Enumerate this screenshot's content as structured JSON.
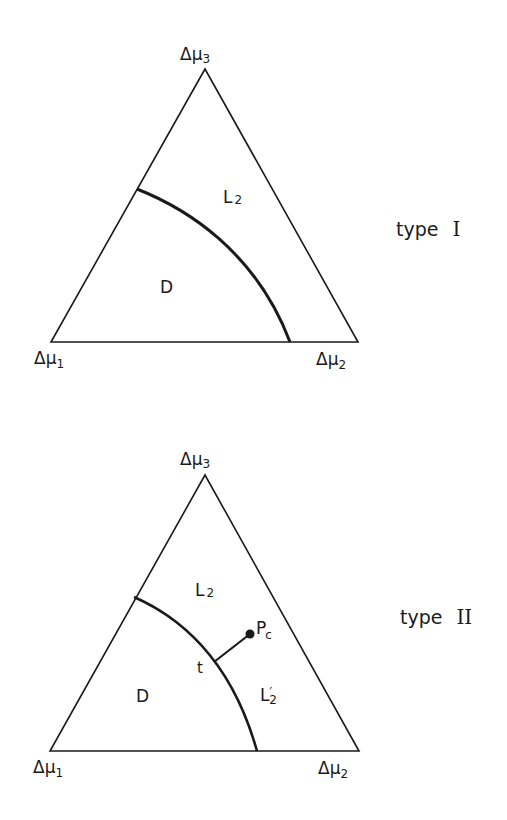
{
  "diagrams": [
    {
      "type_label": "type",
      "type_numeral": "I",
      "vertices": {
        "top": {
          "symbol": "Δμ",
          "subscript": "3"
        },
        "left": {
          "symbol": "Δμ",
          "subscript": "1"
        },
        "right": {
          "symbol": "Δμ",
          "subscript": "2"
        }
      },
      "regions": {
        "D": {
          "main": "D"
        },
        "L2": {
          "main": "L",
          "sub": "2"
        }
      }
    },
    {
      "type_label": "type",
      "type_numeral": "II",
      "vertices": {
        "top": {
          "symbol": "Δμ",
          "subscript": "3"
        },
        "left": {
          "symbol": "Δμ",
          "subscript": "1"
        },
        "right": {
          "symbol": "Δμ",
          "subscript": "2"
        }
      },
      "regions": {
        "D": {
          "main": "D"
        },
        "L2": {
          "main": "L",
          "sub": "2"
        },
        "L2prime": {
          "main": "L",
          "prime": "′",
          "sub": "2"
        }
      },
      "points": {
        "t": {
          "label": "t"
        },
        "Pc": {
          "main": "P",
          "sub": "c"
        }
      }
    }
  ],
  "colors": {
    "line": "#1a1a1a",
    "background": "#ffffff"
  }
}
